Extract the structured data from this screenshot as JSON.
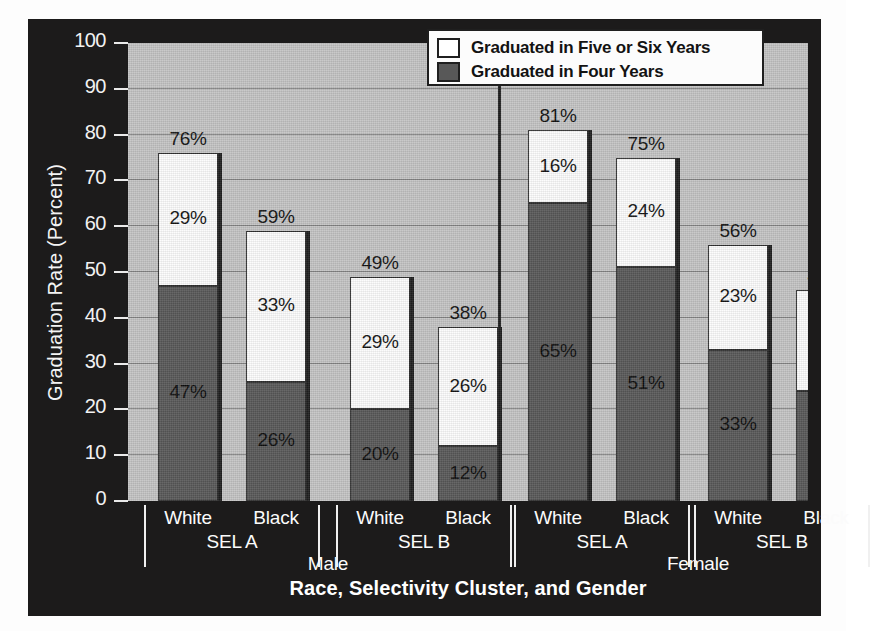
{
  "chart_data": {
    "type": "bar",
    "subtype": "stacked-grouped",
    "title": "",
    "xlabel": "Race, Selectivity Cluster, and Gender",
    "ylabel": "Graduation Rate (Percent)",
    "ylim": [
      0,
      100
    ],
    "yticks": [
      0,
      10,
      20,
      30,
      40,
      50,
      60,
      70,
      80,
      90,
      100
    ],
    "ytick_labels": [
      "0",
      "10",
      "20",
      "30",
      "40",
      "50",
      "60",
      "70",
      "80",
      "90",
      "100"
    ],
    "grid": true,
    "grid_axis": "y",
    "legend_position": "top-right",
    "categories": [
      "Male / SEL A / White",
      "Male / SEL A / Black",
      "Male / SEL B / White",
      "Male / SEL B / Black",
      "Female / SEL A / White",
      "Female / SEL A / Black",
      "Female / SEL B / White",
      "Female / SEL B / Black"
    ],
    "series": [
      {
        "name": "Graduated in Four Years",
        "color": "#585858",
        "values": [
          47,
          26,
          20,
          12,
          65,
          51,
          33,
          24
        ],
        "labels": [
          "47%",
          "26%",
          "20%",
          "12%",
          "65%",
          "51%",
          "33%",
          "24%"
        ]
      },
      {
        "name": "Graduated in Five or Six Years",
        "color": "#ffffff",
        "values": [
          29,
          33,
          29,
          26,
          16,
          24,
          23,
          22
        ],
        "labels": [
          "29%",
          "33%",
          "29%",
          "26%",
          "16%",
          "24%",
          "23%",
          "22%"
        ]
      }
    ],
    "totals": [
      76,
      59,
      49,
      38,
      81,
      75,
      56,
      46
    ],
    "total_labels": [
      "76%",
      "59%",
      "49%",
      "38%",
      "81%",
      "75%",
      "56%",
      "46%"
    ]
  },
  "legend": {
    "items": [
      {
        "label": "Graduated in Five or Six Years",
        "color": "#ffffff"
      },
      {
        "label": "Graduated in Four Years",
        "color": "#585858"
      }
    ]
  },
  "axes": {
    "y_title": "Graduation Rate (Percent)",
    "x_title": "Race, Selectivity Cluster, and Gender",
    "y_ticks": [
      "100",
      "90",
      "80",
      "70",
      "60",
      "50",
      "40",
      "30",
      "20",
      "10",
      "0"
    ]
  },
  "x_groups": [
    {
      "sel": "SEL A",
      "gender": "Male",
      "races": [
        "White",
        "Black"
      ]
    },
    {
      "sel": "SEL B",
      "gender": "Male",
      "races": [
        "White",
        "Black"
      ]
    },
    {
      "sel": "SEL A",
      "gender": "Female",
      "races": [
        "White",
        "Black"
      ]
    },
    {
      "sel": "SEL B",
      "gender": "Female",
      "races": [
        "White",
        "Black"
      ]
    }
  ],
  "colors": {
    "frame": "#1c1b1b",
    "plot_background": "#c4c4c4",
    "gridline": "#6e6e6e",
    "four_years": "#585858",
    "five_or_six_years": "#ffffff",
    "axis_text": "#f4f4f4"
  }
}
